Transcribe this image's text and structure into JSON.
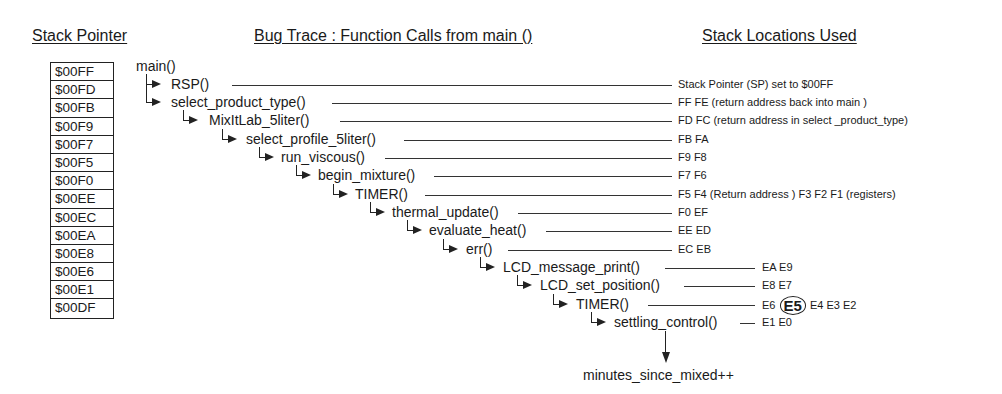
{
  "headers": {
    "stack_pointer": "Stack Pointer",
    "bug_trace": "Bug Trace : Function Calls from main ()",
    "stack_locations": "Stack Locations Used"
  },
  "stack_pointer_values": [
    "$00FF",
    "$00FD",
    "$00FB",
    "$00F9",
    "$00F7",
    "$00F5",
    "$00F0",
    "$00EE",
    "$00EC",
    "$00EA",
    "$00E8",
    "$00E6",
    "$00E1",
    "$00DF"
  ],
  "root_function": "main()",
  "calls": [
    {
      "name": "RSP()",
      "depth": 0,
      "stack": "Stack Pointer (SP) set to $00FF"
    },
    {
      "name": "select_product_type()",
      "depth": 0,
      "stack": "FF FE (return address back into main )"
    },
    {
      "name": "MixItLab_5liter()",
      "depth": 1,
      "stack": "FD FC (return address in select _product_type)"
    },
    {
      "name": "select_profile_5liter()",
      "depth": 2,
      "stack": "FB FA"
    },
    {
      "name": "run_viscous()",
      "depth": 3,
      "stack": "F9 F8"
    },
    {
      "name": "begin_mixture()",
      "depth": 4,
      "stack": "F7 F6"
    },
    {
      "name": "TIMER()",
      "depth": 5,
      "stack": "F5 F4 (Return address ) F3 F2 F1 (registers)"
    },
    {
      "name": "thermal_update()",
      "depth": 6,
      "stack": "F0 EF"
    },
    {
      "name": "evaluate_heat()",
      "depth": 7,
      "stack": "EE ED"
    },
    {
      "name": "err()",
      "depth": 8,
      "stack": "EC EB"
    },
    {
      "name": "LCD_message_print()",
      "depth": 9,
      "stack": "EA E9"
    },
    {
      "name": "LCD_set_position()",
      "depth": 10,
      "stack": "E8 E7"
    },
    {
      "name": "TIMER()",
      "depth": 11,
      "stack_before": "E6",
      "stack_highlight": "E5",
      "stack_after": "E4 E3 E2"
    },
    {
      "name": "settling_control()",
      "depth": 12,
      "stack": "E1 E0"
    }
  ],
  "final_statement": "minutes_since_mixed++"
}
